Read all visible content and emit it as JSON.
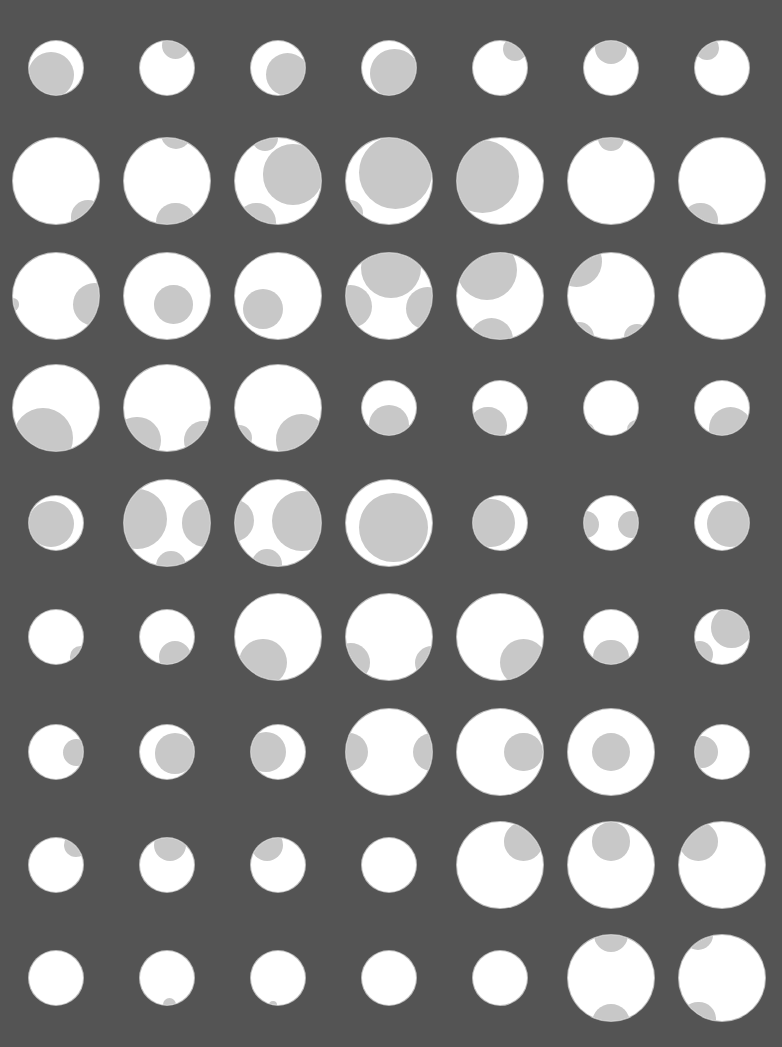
{
  "pattern": {
    "background_color": "#545454",
    "circle_color": "#ffffff",
    "overlay_color": "#c8c8c8",
    "columns_x": [
      56,
      167,
      278,
      389,
      500,
      611,
      722
    ],
    "rows": [
      {
        "y": 68,
        "circles": [
          {
            "r": 27,
            "blobs": [
              [
                -0.2,
                0.25,
                0.85
              ]
            ]
          },
          {
            "r": 27,
            "blobs": [
              [
                0.3,
                -0.85,
                0.5
              ]
            ]
          },
          {
            "r": 27,
            "blobs": [
              [
                0.35,
                0.25,
                0.8
              ]
            ]
          },
          {
            "r": 27,
            "blobs": [
              [
                0.2,
                0.2,
                0.9
              ]
            ]
          },
          {
            "r": 27,
            "blobs": [
              [
                0.55,
                -0.7,
                0.45
              ]
            ]
          },
          {
            "r": 27,
            "blobs": [
              [
                0.0,
                -0.75,
                0.6
              ]
            ]
          },
          {
            "r": 27,
            "blobs": [
              [
                -0.55,
                -0.75,
                0.45
              ]
            ]
          }
        ]
      },
      {
        "y": 181,
        "circles": [
          {
            "r": 43,
            "blobs": [
              [
                0.75,
                0.85,
                0.4
              ]
            ]
          },
          {
            "r": 43,
            "blobs": [
              [
                0.2,
                -1.1,
                0.35
              ],
              [
                0.2,
                0.95,
                0.45
              ]
            ]
          },
          {
            "r": 43,
            "blobs": [
              [
                0.35,
                -0.15,
                0.7
              ],
              [
                -0.5,
                0.95,
                0.45
              ],
              [
                -0.3,
                -1.0,
                0.3
              ]
            ]
          },
          {
            "r": 43,
            "blobs": [
              [
                0.15,
                -0.2,
                0.85
              ],
              [
                -0.9,
                0.75,
                0.3
              ]
            ]
          },
          {
            "r": 43,
            "blobs": [
              [
                -0.4,
                -0.1,
                0.85
              ]
            ]
          },
          {
            "r": 43,
            "blobs": [
              [
                0.0,
                -1.0,
                0.3
              ]
            ]
          },
          {
            "r": 43,
            "blobs": [
              [
                -0.5,
                0.9,
                0.4
              ]
            ]
          }
        ]
      },
      {
        "y": 296,
        "circles": [
          {
            "r": 43,
            "blobs": [
              [
                0.9,
                0.2,
                0.5
              ],
              [
                -1.0,
                0.2,
                0.15
              ]
            ]
          },
          {
            "r": 43,
            "blobs": [
              [
                0.15,
                0.2,
                0.45
              ]
            ]
          },
          {
            "r": 43,
            "blobs": [
              [
                -0.35,
                0.3,
                0.47
              ]
            ]
          },
          {
            "r": 43,
            "blobs": [
              [
                0.05,
                -0.65,
                0.7
              ],
              [
                -0.9,
                0.25,
                0.5
              ],
              [
                0.9,
                0.3,
                0.5
              ]
            ]
          },
          {
            "r": 43,
            "blobs": [
              [
                -0.3,
                -0.6,
                0.7
              ],
              [
                -0.2,
                1.0,
                0.5
              ]
            ]
          },
          {
            "r": 43,
            "blobs": [
              [
                -0.8,
                -0.8,
                0.6
              ],
              [
                -0.75,
                0.95,
                0.35
              ],
              [
                0.6,
                0.95,
                0.3
              ]
            ]
          },
          {
            "r": 43,
            "blobs": []
          }
        ]
      },
      {
        "y": 408,
        "circles": [
          {
            "r": 43,
            "blobs": [
              [
                -0.3,
                0.7,
                0.7
              ]
            ]
          },
          {
            "r": 43,
            "blobs": [
              [
                -0.7,
                0.75,
                0.55
              ],
              [
                0.85,
                0.75,
                0.45
              ]
            ]
          },
          {
            "r": 43,
            "blobs": [
              [
                -0.9,
                0.7,
                0.3
              ],
              [
                0.55,
                0.75,
                0.6
              ]
            ]
          },
          {
            "r": 27,
            "blobs": [
              [
                0.0,
                0.65,
                0.75
              ]
            ]
          },
          {
            "r": 27,
            "blobs": [
              [
                -0.45,
                0.65,
                0.7
              ]
            ]
          },
          {
            "r": 27,
            "blobs": [
              [
                -1.0,
                0.9,
                0.4
              ],
              [
                0.95,
                0.8,
                0.35
              ]
            ]
          },
          {
            "r": 27,
            "blobs": [
              [
                0.3,
                0.75,
                0.8
              ]
            ]
          }
        ]
      },
      {
        "y": 523,
        "circles": [
          {
            "r": 27,
            "blobs": [
              [
                -0.2,
                0.05,
                0.85
              ]
            ]
          },
          {
            "r": 43,
            "blobs": [
              [
                -0.7,
                -0.1,
                0.7
              ],
              [
                0.9,
                0.0,
                0.55
              ],
              [
                0.1,
                1.0,
                0.35
              ]
            ]
          },
          {
            "r": 43,
            "blobs": [
              [
                -1.05,
                -0.05,
                0.5
              ],
              [
                0.55,
                -0.05,
                0.7
              ],
              [
                -0.25,
                0.95,
                0.35
              ]
            ]
          },
          {
            "r": 43,
            "blobs": [
              [
                0.1,
                0.1,
                0.8
              ]
            ]
          },
          {
            "r": 27,
            "blobs": [
              [
                -0.35,
                0.0,
                0.9
              ]
            ]
          },
          {
            "r": 27,
            "blobs": [
              [
                -0.95,
                0.05,
                0.5
              ],
              [
                0.75,
                0.05,
                0.5
              ]
            ]
          },
          {
            "r": 27,
            "blobs": [
              [
                0.3,
                0.05,
                0.85
              ]
            ]
          }
        ]
      },
      {
        "y": 637,
        "circles": [
          {
            "r": 27,
            "blobs": [
              [
                0.9,
                0.75,
                0.4
              ]
            ]
          },
          {
            "r": 27,
            "blobs": [
              [
                0.3,
                0.75,
                0.6
              ]
            ]
          },
          {
            "r": 43,
            "blobs": [
              [
                -0.35,
                0.6,
                0.55
              ]
            ]
          },
          {
            "r": 43,
            "blobs": [
              [
                -0.9,
                0.6,
                0.45
              ],
              [
                1.0,
                0.6,
                0.4
              ]
            ]
          },
          {
            "r": 43,
            "blobs": [
              [
                0.55,
                0.6,
                0.55
              ]
            ]
          },
          {
            "r": 27,
            "blobs": [
              [
                0.0,
                0.75,
                0.65
              ]
            ]
          },
          {
            "r": 27,
            "blobs": [
              [
                0.35,
                -0.35,
                0.75
              ],
              [
                -0.85,
                0.65,
                0.5
              ]
            ]
          }
        ]
      },
      {
        "y": 752,
        "circles": [
          {
            "r": 27,
            "blobs": [
              [
                0.75,
                0.0,
                0.5
              ]
            ]
          },
          {
            "r": 27,
            "blobs": [
              [
                0.3,
                0.05,
                0.75
              ]
            ]
          },
          {
            "r": 27,
            "blobs": [
              [
                -0.45,
                0.0,
                0.75
              ]
            ]
          },
          {
            "r": 43,
            "blobs": [
              [
                -0.95,
                0.0,
                0.45
              ],
              [
                1.0,
                0.0,
                0.45
              ]
            ]
          },
          {
            "r": 43,
            "blobs": [
              [
                0.55,
                0.0,
                0.45
              ]
            ]
          },
          {
            "r": 43,
            "blobs": [
              [
                0.0,
                0.0,
                0.45
              ]
            ]
          },
          {
            "r": 27,
            "blobs": [
              [
                -0.75,
                0.0,
                0.6
              ]
            ]
          }
        ]
      },
      {
        "y": 865,
        "circles": [
          {
            "r": 27,
            "blobs": [
              [
                0.75,
                -0.75,
                0.45
              ]
            ]
          },
          {
            "r": 27,
            "blobs": [
              [
                0.1,
                -0.75,
                0.6
              ]
            ]
          },
          {
            "r": 27,
            "blobs": [
              [
                -0.4,
                -0.75,
                0.6
              ]
            ]
          },
          {
            "r": 27,
            "blobs": []
          },
          {
            "r": 43,
            "blobs": [
              [
                0.55,
                -0.55,
                0.45
              ]
            ]
          },
          {
            "r": 43,
            "blobs": [
              [
                0.0,
                -0.55,
                0.45
              ]
            ]
          },
          {
            "r": 43,
            "blobs": [
              [
                -0.55,
                -0.55,
                0.45
              ]
            ]
          }
        ]
      },
      {
        "y": 978,
        "circles": [
          {
            "r": 27,
            "blobs": []
          },
          {
            "r": 27,
            "blobs": [
              [
                0.1,
                1.0,
                0.25
              ]
            ]
          },
          {
            "r": 27,
            "blobs": [
              [
                -0.2,
                1.0,
                0.15
              ]
            ]
          },
          {
            "r": 27,
            "blobs": []
          },
          {
            "r": 27,
            "blobs": []
          },
          {
            "r": 43,
            "blobs": [
              [
                0.0,
                -1.0,
                0.4
              ],
              [
                0.0,
                1.05,
                0.45
              ]
            ]
          },
          {
            "r": 43,
            "blobs": [
              [
                -0.55,
                -1.0,
                0.35
              ],
              [
                -0.55,
                0.95,
                0.4
              ]
            ]
          }
        ]
      }
    ]
  }
}
